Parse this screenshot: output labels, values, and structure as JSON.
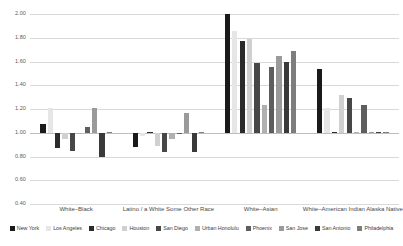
{
  "chart_data": {
    "type": "bar",
    "title": "",
    "subtitle": "",
    "xlabel": "",
    "ylabel": "",
    "ylim": [
      0.4,
      2.0
    ],
    "yticks": [
      "0.40",
      "0.60",
      "0.80",
      "1.00",
      "1.20",
      "1.40",
      "1.60",
      "1.80",
      "2.00"
    ],
    "ytick_values": [
      0.4,
      0.6,
      0.8,
      1.0,
      1.2,
      1.4,
      1.6,
      1.8,
      2.0
    ],
    "grid": true,
    "baseline": 1.0,
    "legend_position": "bottom",
    "categories": [
      "White–Black",
      "Latino / a White Some Other Race",
      "White–Asian",
      "White–American Indian Alaska Native"
    ],
    "series": [
      {
        "name": "New York",
        "color": "#1a1a1a",
        "values": [
          1.07,
          0.88,
          2.0,
          1.54
        ]
      },
      {
        "name": "Los Angeles",
        "color": "#e6e6e6",
        "values": [
          1.21,
          0.97,
          1.86,
          1.21
        ]
      },
      {
        "name": "Chicago",
        "color": "#2b2b2b",
        "values": [
          0.87,
          1.0,
          1.77,
          1.0
        ]
      },
      {
        "name": "Houston",
        "color": "#d0d0d0",
        "values": [
          0.95,
          0.89,
          1.79,
          1.32
        ]
      },
      {
        "name": "San Diego",
        "color": "#474747",
        "values": [
          0.85,
          0.84,
          1.59,
          1.29
        ]
      },
      {
        "name": "Urban Honolulu",
        "color": "#b0b0b0",
        "values": [
          0.99,
          0.95,
          1.23,
          1.0
        ]
      },
      {
        "name": "Phoenix",
        "color": "#5e5e5e",
        "values": [
          1.05,
          0.99,
          1.55,
          1.23
        ]
      },
      {
        "name": "San Jose",
        "color": "#9a9a9a",
        "values": [
          1.21,
          1.17,
          1.65,
          1.0
        ]
      },
      {
        "name": "San Antonio",
        "color": "#3a3a3a",
        "values": [
          0.8,
          0.84,
          1.6,
          1.0
        ]
      },
      {
        "name": "Philadelphia",
        "color": "#7d7d7d",
        "values": [
          1.0,
          1.0,
          1.69,
          1.0
        ]
      }
    ]
  }
}
